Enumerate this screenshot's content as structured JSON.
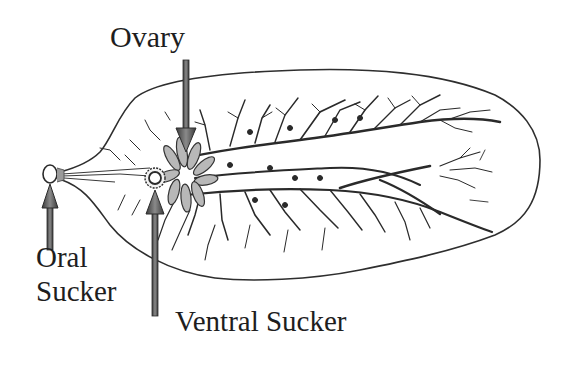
{
  "figure": {
    "labels": {
      "ovary": "Ovary",
      "oral_sucker_line1": "Oral",
      "oral_sucker_line2": "Sucker",
      "ventral_sucker": "Ventral Sucker"
    },
    "structures": [
      {
        "name": "body-outline",
        "description": "leaf-shaped flattened body"
      },
      {
        "name": "oral-sucker",
        "description": "small ring at anterior tip"
      },
      {
        "name": "ventral-sucker",
        "description": "ring behind oral sucker"
      },
      {
        "name": "ovary",
        "description": "branched lobed organ near ventral sucker"
      },
      {
        "name": "intestinal-branches",
        "description": "dendritic gut caeca"
      }
    ],
    "arrows": [
      {
        "target": "ovary",
        "direction": "down"
      },
      {
        "target": "oral-sucker",
        "direction": "up"
      },
      {
        "target": "ventral-sucker",
        "direction": "up"
      }
    ],
    "colors": {
      "line": "#2a2a2a",
      "arrow_fill": "#6a6a6a",
      "arrow_stroke": "#2c2c2c",
      "background": "#ffffff"
    }
  }
}
